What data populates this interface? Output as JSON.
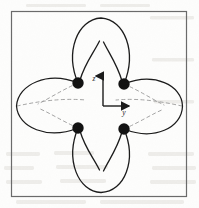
{
  "figure": {
    "title": "Four-lobed surface with four nodal points and coordinate axes",
    "kind": "line-drawing",
    "background_color": "#fdfdfc",
    "ink_color": "#1a1a1a",
    "hidden_line_color": "#8d8d8d",
    "scan_artifact_color": "#d9d6d0",
    "frame": {
      "label": "figure-border",
      "x": 11,
      "y": 11,
      "width": 176,
      "height": 186,
      "stroke_color": "#6a6a6a",
      "stroke_width": 1.2,
      "fill": "none"
    },
    "axes": {
      "origin_x": 103,
      "origin_y": 106,
      "vertical": {
        "label": "z",
        "label_x": 95,
        "label_y": 80,
        "from_x": 103,
        "from_y": 106,
        "to_x": 103,
        "to_y": 73,
        "arrow": "up"
      },
      "horizontal": {
        "label": "y",
        "label_x": 124,
        "label_y": 113,
        "from_x": 103,
        "from_y": 106,
        "to_x": 133,
        "to_y": 106,
        "arrow": "right"
      }
    },
    "nodes": [
      {
        "name": "node-top-left",
        "cx": 78,
        "cy": 83,
        "r": 5.6
      },
      {
        "name": "node-top-right",
        "cx": 124,
        "cy": 84,
        "r": 5.6
      },
      {
        "name": "node-bottom-left",
        "cx": 78,
        "cy": 128,
        "r": 5.6
      },
      {
        "name": "node-bottom-right",
        "cx": 124,
        "cy": 129,
        "r": 5.6
      }
    ],
    "lobes": [
      {
        "name": "lobe-top",
        "orientation": "up",
        "outer_path": "M78,83 C66,52 78,20 101,18 C124,20 136,52 124,84",
        "inner_left_path": "M78,83 C84,66 92,56 99,42",
        "inner_right_path": "M124,84 C118,66 111,57 104,43"
      },
      {
        "name": "lobe-bottom",
        "orientation": "down",
        "outer_path": "M78,128 C66,160 79,191 101,192 C124,191 136,160 124,129",
        "inner_left_path": "M78,128 C84,146 92,156 99,170",
        "inner_right_path": "M124,129 C118,146 111,155 104,169"
      },
      {
        "name": "lobe-left",
        "orientation": "left",
        "outer_path": "M78,83 C48,72 18,85 17,106 C18,127 48,139 78,128",
        "inner_top_path": "M78,83 C62,90 50,98 38,104",
        "inner_bottom_path": "M78,128 C62,121 50,113 38,108",
        "hidden": true
      },
      {
        "name": "lobe-right",
        "orientation": "right",
        "outer_path": "M124,84 C154,73 182,85 182,106 C182,127 154,140 124,129",
        "inner_top_path": "M124,84 C140,91 152,99 164,105",
        "inner_bottom_path": "M124,129 C140,122 152,114 164,109",
        "hidden": true
      }
    ],
    "scan_artifacts": {
      "description": "faint bleed-through of text from reverse of page",
      "present": true
    }
  }
}
